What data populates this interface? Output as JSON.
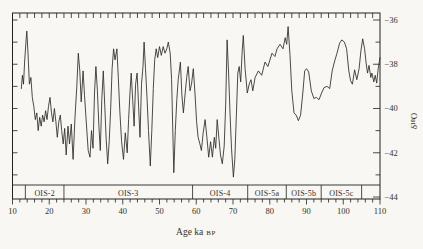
{
  "colors": {
    "background": "#f8f7f3",
    "axis": "#23221f",
    "line": "#2d2b28",
    "text": "#35312b"
  },
  "chart_data": {
    "type": "line",
    "title": "",
    "xlabel": "Age ka BP",
    "ylabel": "δ¹⁸O",
    "grid": false,
    "legend": "none",
    "x_axis": {
      "label_main": "Age ka",
      "label_suffix": "BP",
      "min": 10,
      "max": 110,
      "major_tick_interval": 10,
      "minor_tick_interval": 2,
      "tick_values": [
        10,
        20,
        30,
        40,
        50,
        60,
        70,
        80,
        90,
        100,
        110
      ],
      "tick_labels": [
        "10",
        "20",
        "30",
        "40",
        "50",
        "60",
        "70",
        "80",
        "90",
        "100",
        "110"
      ]
    },
    "y_axis": {
      "label": "δ¹⁸O",
      "side": "right",
      "min": -44,
      "max": -35.6,
      "major_tick_interval": 2,
      "minor_tick_interval": 1,
      "tick_values": [
        -36,
        -38,
        -40,
        -42,
        -44
      ],
      "tick_labels": [
        "−36",
        "−38",
        "−40",
        "−42",
        "−44"
      ]
    },
    "stage_band": {
      "stages": [
        {
          "label": "",
          "start": 10,
          "end": 13.5
        },
        {
          "label": "OIS-2",
          "start": 13.5,
          "end": 24
        },
        {
          "label": "OIS-3",
          "start": 24,
          "end": 59
        },
        {
          "label": "OIS-4",
          "start": 59,
          "end": 74
        },
        {
          "label": "OIS-5a",
          "start": 74,
          "end": 84.5
        },
        {
          "label": "OIS-5b",
          "start": 84.5,
          "end": 94
        },
        {
          "label": "OIS-5c",
          "start": 94,
          "end": 105
        },
        {
          "label": "",
          "start": 105,
          "end": 110
        }
      ]
    },
    "series": [
      {
        "name": "δ¹⁸O",
        "points": [
          [
            12.4,
            -39.1
          ],
          [
            12.7,
            -38.5
          ],
          [
            13.0,
            -38.9
          ],
          [
            13.3,
            -37.9
          ],
          [
            13.7,
            -36.9
          ],
          [
            13.9,
            -36.5
          ],
          [
            14.2,
            -37.4
          ],
          [
            14.6,
            -38.9
          ],
          [
            15.0,
            -38.6
          ],
          [
            15.4,
            -39.5
          ],
          [
            15.8,
            -39.9
          ],
          [
            16.2,
            -40.5
          ],
          [
            16.6,
            -40.2
          ],
          [
            17.0,
            -41.0
          ],
          [
            17.4,
            -40.4
          ],
          [
            17.8,
            -40.8
          ],
          [
            18.2,
            -40.3
          ],
          [
            18.6,
            -40.6
          ],
          [
            19.0,
            -40.1
          ],
          [
            19.4,
            -40.5
          ],
          [
            19.8,
            -39.9
          ],
          [
            20.2,
            -39.5
          ],
          [
            20.6,
            -40.2
          ],
          [
            21.0,
            -40.6
          ],
          [
            21.4,
            -40.0
          ],
          [
            21.8,
            -40.6
          ],
          [
            22.2,
            -41.3
          ],
          [
            22.6,
            -40.6
          ],
          [
            23.0,
            -40.3
          ],
          [
            23.4,
            -41.0
          ],
          [
            23.8,
            -41.6
          ],
          [
            24.2,
            -40.9
          ],
          [
            24.6,
            -42.1
          ],
          [
            25.1,
            -40.8
          ],
          [
            25.5,
            -41.6
          ],
          [
            26.0,
            -40.7
          ],
          [
            26.5,
            -42.3
          ],
          [
            27.0,
            -40.4
          ],
          [
            27.5,
            -39.0
          ],
          [
            27.9,
            -37.5
          ],
          [
            28.3,
            -38.3
          ],
          [
            28.7,
            -39.7
          ],
          [
            29.2,
            -38.3
          ],
          [
            29.6,
            -39.4
          ],
          [
            30.1,
            -40.7
          ],
          [
            30.6,
            -41.9
          ],
          [
            31.1,
            -42.2
          ],
          [
            31.5,
            -41.0
          ],
          [
            31.9,
            -41.8
          ],
          [
            32.3,
            -39.3
          ],
          [
            32.7,
            -38.1
          ],
          [
            33.1,
            -39.2
          ],
          [
            33.5,
            -40.8
          ],
          [
            33.9,
            -41.9
          ],
          [
            34.3,
            -39.6
          ],
          [
            34.7,
            -38.3
          ],
          [
            35.1,
            -39.8
          ],
          [
            35.5,
            -41.4
          ],
          [
            35.9,
            -42.5
          ],
          [
            36.3,
            -41.5
          ],
          [
            36.7,
            -40.1
          ],
          [
            37.1,
            -38.2
          ],
          [
            37.5,
            -37.3
          ],
          [
            37.9,
            -37.8
          ],
          [
            38.4,
            -37.3
          ],
          [
            38.8,
            -38.6
          ],
          [
            39.2,
            -40.1
          ],
          [
            39.7,
            -41.5
          ],
          [
            40.2,
            -42.3
          ],
          [
            40.7,
            -41.1
          ],
          [
            41.2,
            -42.0
          ],
          [
            41.6,
            -40.5
          ],
          [
            42.0,
            -39.2
          ],
          [
            42.3,
            -38.4
          ],
          [
            42.7,
            -39.6
          ],
          [
            43.1,
            -40.8
          ],
          [
            43.5,
            -38.9
          ],
          [
            43.9,
            -38.4
          ],
          [
            44.3,
            -39.9
          ],
          [
            44.7,
            -41.3
          ],
          [
            45.1,
            -38.9
          ],
          [
            45.5,
            -38.1
          ],
          [
            45.8,
            -37.0
          ],
          [
            46.2,
            -38.2
          ],
          [
            46.6,
            -39.5
          ],
          [
            47.0,
            -41.0
          ],
          [
            47.5,
            -42.6
          ],
          [
            47.9,
            -41.0
          ],
          [
            48.3,
            -39.1
          ],
          [
            48.7,
            -37.8
          ],
          [
            49.1,
            -37.3
          ],
          [
            49.5,
            -37.7
          ],
          [
            50.0,
            -37.2
          ],
          [
            50.5,
            -37.6
          ],
          [
            51.0,
            -37.2
          ],
          [
            51.5,
            -37.5
          ],
          [
            52.0,
            -37.3
          ],
          [
            52.4,
            -37.0
          ],
          [
            52.9,
            -37.5
          ],
          [
            53.3,
            -38.7
          ],
          [
            53.6,
            -40.8
          ],
          [
            53.9,
            -42.9
          ],
          [
            54.3,
            -41.0
          ],
          [
            54.7,
            -39.6
          ],
          [
            55.1,
            -38.7
          ],
          [
            55.7,
            -37.9
          ],
          [
            56.1,
            -39.4
          ],
          [
            56.5,
            -40.2
          ],
          [
            57.0,
            -39.3
          ],
          [
            57.4,
            -38.6
          ],
          [
            57.8,
            -38.1
          ],
          [
            58.3,
            -39.2
          ],
          [
            58.7,
            -38.9
          ],
          [
            59.2,
            -38.2
          ],
          [
            59.7,
            -39.4
          ],
          [
            60.1,
            -40.6
          ],
          [
            60.5,
            -41.3
          ],
          [
            61.0,
            -41.6
          ],
          [
            61.4,
            -41.9
          ],
          [
            61.9,
            -41.1
          ],
          [
            62.4,
            -40.5
          ],
          [
            62.9,
            -41.3
          ],
          [
            63.4,
            -42.2
          ],
          [
            63.9,
            -41.5
          ],
          [
            64.4,
            -42.2
          ],
          [
            64.9,
            -41.3
          ],
          [
            65.3,
            -41.8
          ],
          [
            65.7,
            -40.5
          ],
          [
            66.2,
            -41.4
          ],
          [
            66.6,
            -42.1
          ],
          [
            67.1,
            -42.5
          ],
          [
            67.6,
            -41.7
          ],
          [
            68.0,
            -39.8
          ],
          [
            68.4,
            -36.9
          ],
          [
            68.8,
            -38.4
          ],
          [
            69.2,
            -40.3
          ],
          [
            69.6,
            -41.8
          ],
          [
            70.1,
            -43.1
          ],
          [
            70.5,
            -42.3
          ],
          [
            70.9,
            -40.4
          ],
          [
            71.3,
            -38.4
          ],
          [
            71.7,
            -38.1
          ],
          [
            72.1,
            -38.8
          ],
          [
            72.5,
            -37.4
          ],
          [
            72.8,
            -36.7
          ],
          [
            73.3,
            -38.2
          ],
          [
            73.9,
            -39.3
          ],
          [
            74.4,
            -38.9
          ],
          [
            74.9,
            -38.7
          ],
          [
            75.4,
            -39.2
          ],
          [
            76.0,
            -38.6
          ],
          [
            76.9,
            -38.3
          ],
          [
            77.8,
            -38.5
          ],
          [
            78.7,
            -37.9
          ],
          [
            79.5,
            -38.1
          ],
          [
            80.6,
            -37.5
          ],
          [
            81.4,
            -37.65
          ],
          [
            82.0,
            -37.3
          ],
          [
            82.8,
            -37.1
          ],
          [
            83.6,
            -37.3
          ],
          [
            84.2,
            -36.8
          ],
          [
            84.6,
            -37.1
          ],
          [
            85.0,
            -36.3
          ],
          [
            85.5,
            -37.6
          ],
          [
            86.0,
            -39.2
          ],
          [
            86.6,
            -40.2
          ],
          [
            87.2,
            -40.3
          ],
          [
            87.8,
            -40.55
          ],
          [
            88.4,
            -40.3
          ],
          [
            89.0,
            -39.3
          ],
          [
            89.5,
            -38.3
          ],
          [
            90.0,
            -38.2
          ],
          [
            90.6,
            -38.35
          ],
          [
            91.3,
            -39.2
          ],
          [
            92.0,
            -39.55
          ],
          [
            92.7,
            -39.5
          ],
          [
            93.4,
            -39.6
          ],
          [
            94.1,
            -39.3
          ],
          [
            94.8,
            -39.05
          ],
          [
            95.6,
            -39.0
          ],
          [
            96.3,
            -39.1
          ],
          [
            97.0,
            -38.3
          ],
          [
            97.6,
            -37.9
          ],
          [
            98.3,
            -37.5
          ],
          [
            99.0,
            -37.05
          ],
          [
            99.6,
            -36.9
          ],
          [
            100.3,
            -37.0
          ],
          [
            100.9,
            -37.3
          ],
          [
            101.5,
            -38.3
          ],
          [
            102.0,
            -38.75
          ],
          [
            102.5,
            -38.9
          ],
          [
            103.1,
            -38.25
          ],
          [
            103.7,
            -38.7
          ],
          [
            104.3,
            -38.2
          ],
          [
            104.8,
            -37.4
          ],
          [
            105.3,
            -36.85
          ],
          [
            105.8,
            -37.3
          ],
          [
            106.2,
            -37.9
          ],
          [
            106.6,
            -38.4
          ],
          [
            107.0,
            -38.05
          ],
          [
            107.5,
            -38.6
          ],
          [
            107.8,
            -38.4
          ],
          [
            108.3,
            -38.8
          ],
          [
            108.7,
            -38.5
          ],
          [
            109.1,
            -38.85
          ],
          [
            109.5,
            -38.2
          ],
          [
            110.0,
            -37.7
          ]
        ]
      }
    ]
  }
}
